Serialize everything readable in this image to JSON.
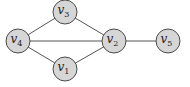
{
  "diagram": {
    "type": "undirected-graph",
    "node_fill": "#d6d6d6",
    "node_stroke": "#4a4a4a",
    "edge_color": "#555555",
    "node_radius": 12,
    "nodes": [
      {
        "id": "v1",
        "base": "v",
        "sub": "1",
        "x": 65,
        "y": 69
      },
      {
        "id": "v2",
        "base": "v",
        "sub": "2",
        "x": 114,
        "y": 41
      },
      {
        "id": "v3",
        "base": "v",
        "sub": "3",
        "x": 65,
        "y": 12
      },
      {
        "id": "v4",
        "base": "v",
        "sub": "4",
        "x": 18,
        "y": 41
      },
      {
        "id": "v5",
        "base": "v",
        "sub": "5",
        "x": 168,
        "y": 41
      }
    ],
    "edges": [
      {
        "from": "v4",
        "to": "v3"
      },
      {
        "from": "v4",
        "to": "v2"
      },
      {
        "from": "v4",
        "to": "v1"
      },
      {
        "from": "v3",
        "to": "v2"
      },
      {
        "from": "v1",
        "to": "v2"
      },
      {
        "from": "v2",
        "to": "v5"
      }
    ]
  }
}
